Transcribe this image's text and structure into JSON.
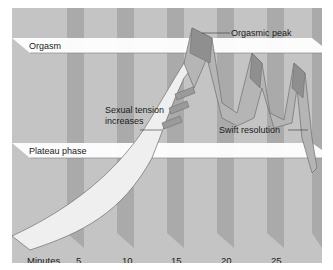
{
  "diagram": {
    "bands": {
      "orgasm": "Orgasm",
      "plateau": "Plateau phase"
    },
    "annotations": {
      "orgasmic_peak": "Orgasmic peak",
      "sexual_tension_line1": "Sexual tension",
      "sexual_tension_line2": "increases",
      "swift_resolution": "Swift resolution"
    },
    "x_axis": {
      "label": "Minutes",
      "ticks": [
        "5",
        "10",
        "15",
        "20",
        "25"
      ]
    },
    "colors": {
      "background": "#c4c4c4",
      "stripe": "#a9a9a9",
      "band": "#ffffff",
      "ribbon_face": "#d2d2d2",
      "ribbon_side": "#9a9a9a",
      "outline": "#6e6e6e"
    }
  }
}
